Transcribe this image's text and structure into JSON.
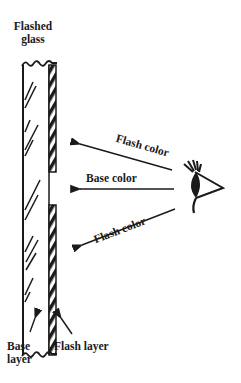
{
  "diagram": {
    "title_label": {
      "line1": "Flashed",
      "line2": "glass"
    },
    "rays": [
      {
        "label": "Flash color",
        "path": "through flash layer (upper)"
      },
      {
        "label": "Base color",
        "path": "through gap in flash layer"
      },
      {
        "label": "Flash color",
        "path": "through flash layer (lower)"
      }
    ],
    "bottom_labels": {
      "base_layer": {
        "line1": "Base",
        "line2": "layer"
      },
      "flash_layer": "Flash layer"
    },
    "viewer": "eye-icon",
    "colors": {
      "ink": "#1a1a1a",
      "background": "#ffffff"
    }
  }
}
